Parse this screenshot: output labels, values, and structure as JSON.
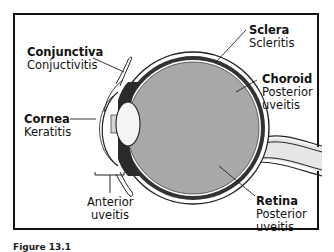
{
  "diagram": {
    "labels": [
      {
        "structure": "Conjunctiva",
        "condition": "Conjuctivitis"
      },
      {
        "structure": "Cornea",
        "condition": "Keratitis"
      },
      {
        "structure": "Sclera",
        "condition": "Scleritis"
      },
      {
        "structure": "Choroid",
        "condition": "Posterior uveitis"
      },
      {
        "structure": "Retina",
        "condition": "Posterior uveitis"
      },
      {
        "structure": "",
        "condition": "Anterior uveitis"
      }
    ],
    "choroid_line1": "Posterior",
    "choroid_line2": "uveitis",
    "retina_line1": "Posterior",
    "retina_line2": "uveitis",
    "anterior_line1": "Anterior",
    "anterior_line2": "uveitis",
    "caption": "Figure 13.1"
  }
}
